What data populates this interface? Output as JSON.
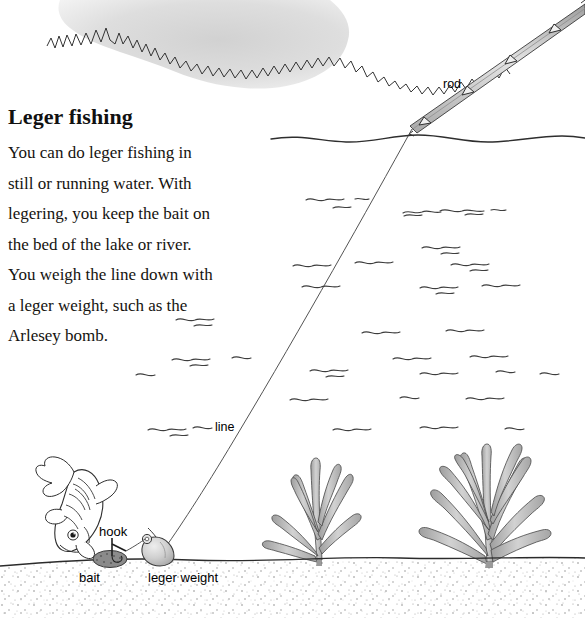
{
  "page": {
    "width": 585,
    "height": 618,
    "background": "#ffffff"
  },
  "article": {
    "heading": "Leger fishing",
    "body": "You can do leger fishing in\nstill or running water. With\nlegering, you keep the bait on\nthe bed of the lake or river.\nYou weigh the line down with\na leger weight, such as the\nArlesey bomb."
  },
  "labels": {
    "rod": "rod",
    "line": "line",
    "hook": "hook",
    "bait": "bait",
    "leger_weight": "leger weight"
  },
  "illustration": {
    "title": "Leger fishing setup diagram",
    "elements": [
      "cloud",
      "fishing-rod",
      "rod-eyelets",
      "fishing-line",
      "water-surface",
      "water-ripples",
      "fish",
      "bait",
      "hook",
      "leger-weight",
      "weed-small",
      "weed-large",
      "lakebed",
      "sand-stipple"
    ],
    "colors": {
      "ink": "#1a1a1a",
      "line": "#444444",
      "cloud_fill": "#d9d9d9",
      "rod_fill": "#c9c9c9",
      "weed_fill": "#b9b9b9",
      "weight_fill": "#c6c6c6",
      "bait_fill": "#8a8a8a",
      "fish_fill": "#ffffff",
      "sand": "#8f8f8f"
    }
  }
}
